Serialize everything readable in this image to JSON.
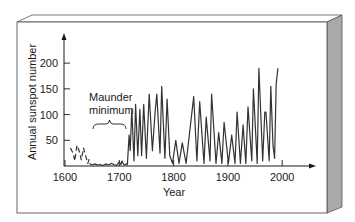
{
  "chart_data": {
    "type": "line",
    "title": "",
    "xlabel": "Year",
    "ylabel": "Annual sunspot number",
    "xlim": [
      1600,
      2050
    ],
    "ylim": [
      0,
      250
    ],
    "xticks": [
      1600,
      1700,
      1800,
      1900,
      2000
    ],
    "yticks": [
      50,
      100,
      150,
      200
    ],
    "grid": false,
    "legend": null,
    "annotations": [
      {
        "text_lines": [
          "Maunder",
          "minimum"
        ],
        "span_years": [
          1645,
          1715
        ],
        "type": "brace"
      }
    ],
    "series": [
      {
        "name": "early-sparse-records",
        "style": "dashed",
        "x": [
          1610,
          1615,
          1618,
          1622,
          1626,
          1630,
          1634,
          1638,
          1642,
          1645
        ],
        "values": [
          35,
          25,
          10,
          40,
          30,
          12,
          35,
          20,
          5,
          15
        ]
      },
      {
        "name": "annual-sunspot-number",
        "style": "solid",
        "x": [
          1645,
          1650,
          1655,
          1660,
          1665,
          1670,
          1675,
          1680,
          1685,
          1690,
          1695,
          1700,
          1703,
          1705,
          1707,
          1710,
          1713,
          1715,
          1718,
          1720,
          1723,
          1727,
          1730,
          1734,
          1738,
          1741,
          1745,
          1750,
          1755,
          1761,
          1766,
          1769,
          1775,
          1778,
          1784,
          1788,
          1793,
          1798,
          1804,
          1810,
          1816,
          1823,
          1830,
          1837,
          1843,
          1848,
          1856,
          1860,
          1867,
          1870,
          1878,
          1883,
          1889,
          1893,
          1901,
          1907,
          1913,
          1917,
          1923,
          1928,
          1933,
          1937,
          1944,
          1947,
          1954,
          1957,
          1960,
          1964,
          1968,
          1970,
          1976,
          1979,
          1983,
          1986,
          1989,
          1992
        ],
        "values": [
          5,
          2,
          4,
          2,
          3,
          1,
          4,
          2,
          5,
          3,
          1,
          8,
          3,
          10,
          5,
          2,
          4,
          3,
          60,
          30,
          110,
          10,
          120,
          20,
          110,
          20,
          120,
          15,
          140,
          30,
          105,
          140,
          25,
          155,
          15,
          130,
          20,
          5,
          50,
          5,
          45,
          5,
          70,
          135,
          10,
          125,
          5,
          95,
          10,
          140,
          5,
          65,
          5,
          85,
          5,
          60,
          5,
          105,
          5,
          80,
          5,
          115,
          10,
          150,
          5,
          190,
          115,
          10,
          105,
          105,
          10,
          155,
          40,
          15,
          160,
          190
        ]
      }
    ]
  },
  "axes": {
    "ylabel": "Annual sunspot number",
    "xlabel": "Year",
    "x_tick_labels": [
      "1600",
      "1700",
      "1800",
      "1900",
      "2000"
    ],
    "y_tick_labels": [
      "50",
      "100",
      "150",
      "200"
    ]
  },
  "annotation": {
    "line1": "Maunder",
    "line2": "minimum"
  },
  "colors": {
    "line": "#333333",
    "frame": "#555555",
    "side_panel": "#a9a9a9",
    "side_panel_dark": "#8c8c8c",
    "text": "#1a1a1a"
  }
}
